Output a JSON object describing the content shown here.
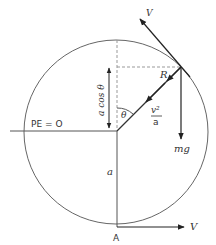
{
  "diagram": {
    "labels": {
      "velocity_top": "V",
      "velocity_bottom": "V",
      "reaction": "R",
      "weight": "mg",
      "accel_num": "v²",
      "accel_den": "a",
      "angle": "θ",
      "height": "a cos θ",
      "radius": "a",
      "pe_zero": "PE = O",
      "point_a": "A"
    },
    "colors": {
      "line": "#555555",
      "arrow": "#222222",
      "dashed": "#999999"
    }
  }
}
